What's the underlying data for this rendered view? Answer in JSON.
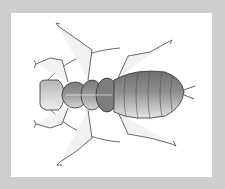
{
  "image": {
    "subject": "insect nymph illustration",
    "style": "stippled pen-and-ink drawing, dorsal view",
    "colors": {
      "background_border": "#cfcfcf",
      "card": "#ffffff",
      "ink": "#333333",
      "body_shade": "#8a8a8a",
      "body_light": "#e6e6e6"
    },
    "parts": [
      "head",
      "antennae",
      "pronotum",
      "mesothorax",
      "metathorax",
      "abdomen",
      "cerci",
      "legs"
    ]
  }
}
